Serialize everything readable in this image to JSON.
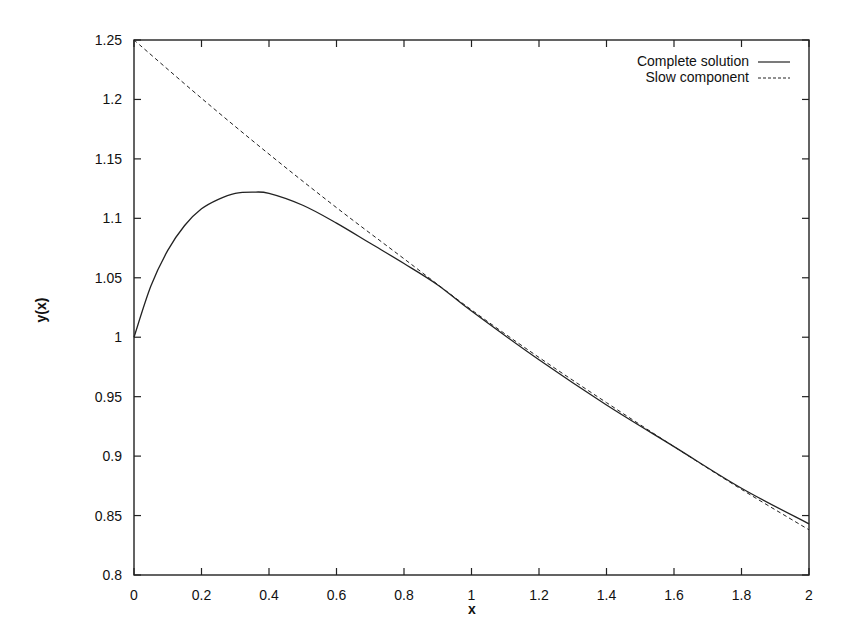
{
  "chart_data": {
    "type": "line",
    "title": "",
    "xlabel": "x",
    "ylabel": "y(x)",
    "xlim": [
      0,
      2
    ],
    "ylim": [
      0.8,
      1.25
    ],
    "grid": false,
    "legend_position": "top-right (inside)",
    "x_ticks": [
      "0",
      "0.2",
      "0.4",
      "0.6",
      "0.8",
      "1",
      "1.2",
      "1.4",
      "1.6",
      "1.8",
      "2"
    ],
    "y_ticks": [
      "0.8",
      "0.85",
      "0.9",
      "0.95",
      "1",
      "1.05",
      "1.1",
      "1.15",
      "1.2",
      "1.25"
    ],
    "series": [
      {
        "name": "Complete solution",
        "style": "solid",
        "x": [
          0,
          0.05,
          0.1,
          0.15,
          0.2,
          0.25,
          0.3,
          0.35,
          0.4,
          0.5,
          0.6,
          0.7,
          0.8,
          0.9,
          1.0,
          1.2,
          1.4,
          1.6,
          1.8,
          2.0
        ],
        "values": [
          1.0,
          1.043,
          1.073,
          1.094,
          1.108,
          1.116,
          1.121,
          1.122,
          1.121,
          1.111,
          1.096,
          1.079,
          1.062,
          1.044,
          1.022,
          0.981,
          0.943,
          0.908,
          0.873,
          0.843
        ]
      },
      {
        "name": "Slow component",
        "style": "dashed",
        "x": [
          0,
          0.2,
          0.4,
          0.6,
          0.8,
          1.0,
          1.2,
          1.4,
          1.6,
          1.8,
          2.0
        ],
        "values": [
          1.25,
          1.201,
          1.154,
          1.109,
          1.066,
          1.023,
          0.983,
          0.945,
          0.908,
          0.872,
          0.838
        ]
      }
    ]
  }
}
